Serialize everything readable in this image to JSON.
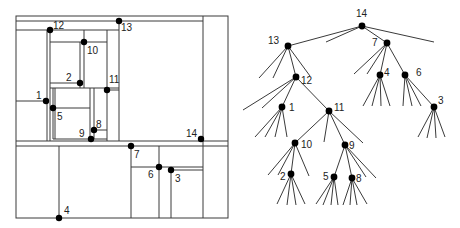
{
  "figure": {
    "colors": {
      "line": "#3a3a3a",
      "point": "#000000",
      "label": "#222222",
      "background": "#ffffff"
    }
  },
  "partition": {
    "frame": {
      "x1": 16,
      "y1": 16,
      "x2": 228,
      "y2": 218
    },
    "segments": [
      [
        16,
        21,
        203,
        21
      ],
      [
        16,
        30,
        119,
        30
      ],
      [
        119,
        21,
        119,
        141
      ],
      [
        203,
        16,
        203,
        218
      ],
      [
        47,
        30,
        47,
        141
      ],
      [
        50,
        30,
        50,
        141
      ],
      [
        50,
        42,
        107,
        42
      ],
      [
        84,
        30,
        84,
        42
      ],
      [
        80,
        42,
        80,
        88
      ],
      [
        84,
        42,
        84,
        88
      ],
      [
        107,
        30,
        107,
        141
      ],
      [
        50,
        83,
        80,
        83
      ],
      [
        50,
        88,
        119,
        88
      ],
      [
        107,
        90,
        119,
        90
      ],
      [
        16,
        101,
        46,
        101
      ],
      [
        53,
        88,
        53,
        139
      ],
      [
        55,
        88,
        55,
        139
      ],
      [
        53,
        108,
        90,
        108
      ],
      [
        90,
        88,
        90,
        139
      ],
      [
        94,
        88,
        94,
        139
      ],
      [
        94,
        130,
        107,
        130
      ],
      [
        53,
        139,
        107,
        139
      ],
      [
        16,
        141,
        228,
        141
      ],
      [
        16,
        146,
        228,
        146
      ],
      [
        59,
        146,
        59,
        218
      ],
      [
        131,
        146,
        131,
        218
      ],
      [
        131,
        167,
        203,
        167
      ],
      [
        159,
        146,
        159,
        218
      ],
      [
        171,
        170,
        203,
        170
      ],
      [
        171,
        170,
        171,
        218
      ]
    ],
    "points": [
      {
        "id": "1",
        "x": 46,
        "y": 101,
        "lx": 36,
        "ly": 99
      },
      {
        "id": "2",
        "x": 80,
        "y": 83,
        "lx": 66,
        "ly": 81
      },
      {
        "id": "3",
        "x": 171,
        "y": 170,
        "lx": 175,
        "ly": 182
      },
      {
        "id": "4",
        "x": 59,
        "y": 218,
        "lx": 64,
        "ly": 214
      },
      {
        "id": "5",
        "x": 53,
        "y": 108,
        "lx": 57,
        "ly": 120
      },
      {
        "id": "6",
        "x": 159,
        "y": 167,
        "lx": 148,
        "ly": 178
      },
      {
        "id": "7",
        "x": 131,
        "y": 146,
        "lx": 134,
        "ly": 158
      },
      {
        "id": "8",
        "x": 94,
        "y": 130,
        "lx": 96,
        "ly": 128
      },
      {
        "id": "9",
        "x": 91,
        "y": 139,
        "lx": 79,
        "ly": 137
      },
      {
        "id": "10",
        "x": 84,
        "y": 42,
        "lx": 87,
        "ly": 54
      },
      {
        "id": "11",
        "x": 107,
        "y": 90,
        "lx": 109,
        "ly": 83
      },
      {
        "id": "12",
        "x": 50,
        "y": 30,
        "lx": 53,
        "ly": 29
      },
      {
        "id": "13",
        "x": 119,
        "y": 21,
        "lx": 121,
        "ly": 31
      },
      {
        "id": "14",
        "x": 201,
        "y": 139,
        "lx": 186,
        "ly": 137
      }
    ]
  },
  "tree": {
    "nodes": [
      {
        "id": "14",
        "x": 362,
        "y": 26,
        "lx": 356,
        "ly": 17
      },
      {
        "id": "13",
        "x": 288,
        "y": 46,
        "lx": 268,
        "ly": 44
      },
      {
        "id": "7",
        "x": 387,
        "y": 43,
        "lx": 372,
        "ly": 46
      },
      {
        "id": "12",
        "x": 296,
        "y": 77,
        "lx": 301,
        "ly": 84
      },
      {
        "id": "4",
        "x": 380,
        "y": 75,
        "lx": 384,
        "ly": 76
      },
      {
        "id": "6",
        "x": 405,
        "y": 75,
        "lx": 416,
        "ly": 76
      },
      {
        "id": "1",
        "x": 282,
        "y": 107,
        "lx": 289,
        "ly": 111
      },
      {
        "id": "11",
        "x": 329,
        "y": 111,
        "lx": 334,
        "ly": 111
      },
      {
        "id": "3",
        "x": 434,
        "y": 107,
        "lx": 438,
        "ly": 104
      },
      {
        "id": "10",
        "x": 295,
        "y": 143,
        "lx": 301,
        "ly": 148
      },
      {
        "id": "9",
        "x": 345,
        "y": 145,
        "lx": 349,
        "ly": 149
      },
      {
        "id": "2",
        "x": 291,
        "y": 174,
        "lx": 280,
        "ly": 180
      },
      {
        "id": "5",
        "x": 334,
        "y": 177,
        "lx": 323,
        "ly": 180
      },
      {
        "id": "8",
        "x": 352,
        "y": 178,
        "lx": 356,
        "ly": 182
      }
    ],
    "edges": [
      [
        362,
        26,
        288,
        46
      ],
      [
        362,
        26,
        326,
        42
      ],
      [
        362,
        26,
        387,
        43
      ],
      [
        362,
        26,
        434,
        42
      ],
      [
        288,
        46,
        259,
        78
      ],
      [
        288,
        46,
        273,
        78
      ],
      [
        288,
        46,
        296,
        77
      ],
      [
        288,
        46,
        310,
        76
      ],
      [
        387,
        43,
        354,
        74
      ],
      [
        387,
        43,
        367,
        74
      ],
      [
        387,
        43,
        380,
        75
      ],
      [
        387,
        43,
        405,
        75
      ],
      [
        296,
        77,
        243,
        110
      ],
      [
        296,
        77,
        262,
        108
      ],
      [
        296,
        77,
        282,
        107
      ],
      [
        296,
        77,
        329,
        111
      ],
      [
        380,
        75,
        363,
        106
      ],
      [
        380,
        75,
        372,
        106
      ],
      [
        380,
        75,
        381,
        106
      ],
      [
        380,
        75,
        390,
        106
      ],
      [
        405,
        75,
        403,
        106
      ],
      [
        405,
        75,
        412,
        106
      ],
      [
        405,
        75,
        421,
        106
      ],
      [
        405,
        75,
        434,
        107
      ],
      [
        282,
        107,
        255,
        137
      ],
      [
        282,
        107,
        265,
        137
      ],
      [
        282,
        107,
        275,
        137
      ],
      [
        282,
        107,
        287,
        137
      ],
      [
        329,
        111,
        295,
        143
      ],
      [
        329,
        111,
        324,
        142
      ],
      [
        329,
        111,
        345,
        145
      ],
      [
        329,
        111,
        363,
        143
      ],
      [
        434,
        107,
        418,
        137
      ],
      [
        434,
        107,
        427,
        138
      ],
      [
        434,
        107,
        436,
        138
      ],
      [
        434,
        107,
        445,
        137
      ],
      [
        295,
        143,
        268,
        175
      ],
      [
        295,
        143,
        278,
        175
      ],
      [
        295,
        143,
        291,
        174
      ],
      [
        295,
        143,
        309,
        176
      ],
      [
        345,
        145,
        334,
        177
      ],
      [
        345,
        145,
        352,
        178
      ],
      [
        345,
        145,
        366,
        177
      ],
      [
        345,
        145,
        376,
        178
      ],
      [
        291,
        174,
        277,
        204
      ],
      [
        291,
        174,
        287,
        205
      ],
      [
        291,
        174,
        296,
        205
      ],
      [
        291,
        174,
        305,
        204
      ],
      [
        334,
        177,
        316,
        204
      ],
      [
        334,
        177,
        323,
        205
      ],
      [
        334,
        177,
        331,
        205
      ],
      [
        334,
        177,
        338,
        205
      ],
      [
        352,
        178,
        343,
        205
      ],
      [
        352,
        178,
        350,
        205
      ],
      [
        352,
        178,
        357,
        205
      ],
      [
        352,
        178,
        367,
        204
      ]
    ]
  }
}
